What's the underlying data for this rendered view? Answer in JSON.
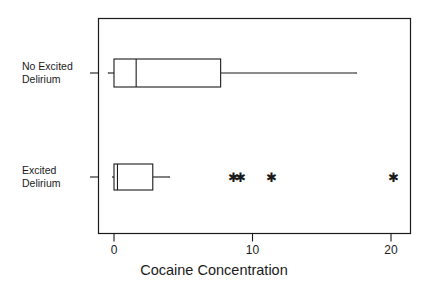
{
  "chart_data": {
    "type": "box",
    "title": "",
    "xlabel": "Cocaine Concentration",
    "ylabel": "",
    "orientation": "horizontal",
    "xlim": [
      -1.2,
      22.6
    ],
    "xticks": [
      0,
      10,
      20
    ],
    "xticklabels": [
      "0",
      "10",
      "20"
    ],
    "grid": false,
    "legend": "none",
    "frame": "box",
    "categories": [
      "No Excited Delirium",
      "Excited Delirium"
    ],
    "series": [
      {
        "name": "No Excited Delirium",
        "label_line1": "No Excited",
        "label_line2": "Delirium",
        "whisker_low": -0.4,
        "q1": 0.0,
        "median": 1.6,
        "q3": 7.7,
        "whisker_high": 17.5,
        "outliers": []
      },
      {
        "name": "Excited Delirium",
        "label_line1": "Excited",
        "label_line2": "Delirium",
        "whisker_low": -0.1,
        "q1": 0.0,
        "median": 0.25,
        "q3": 2.8,
        "whisker_high": 4.0,
        "outliers": [
          8.6,
          9.1,
          11.4,
          20.2
        ]
      }
    ],
    "outlier_marker": "asterisk",
    "line_color": "#1a1a1a",
    "fill_color": "#ffffff",
    "background_color": "#ffffff"
  },
  "axis": {
    "tick_0": "0",
    "tick_10": "10",
    "tick_20": "20",
    "title": "Cocaine Concentration"
  },
  "labels": {
    "row0": "No Excited\nDelirium",
    "row1": "Excited\nDelirium"
  }
}
